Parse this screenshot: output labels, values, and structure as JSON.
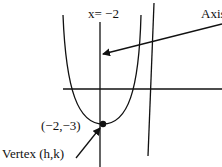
{
  "diagram": {
    "labels": {
      "axis_equation": "x= −2",
      "axis_callout": "Axis of symmetry",
      "vertex_point": "(−2,−3)",
      "vertex_callout": "Vertex (h,k)"
    },
    "vertex": {
      "h": -2,
      "k": -3
    },
    "colors": {
      "stroke": "#111111",
      "background": "#ffffff"
    }
  }
}
